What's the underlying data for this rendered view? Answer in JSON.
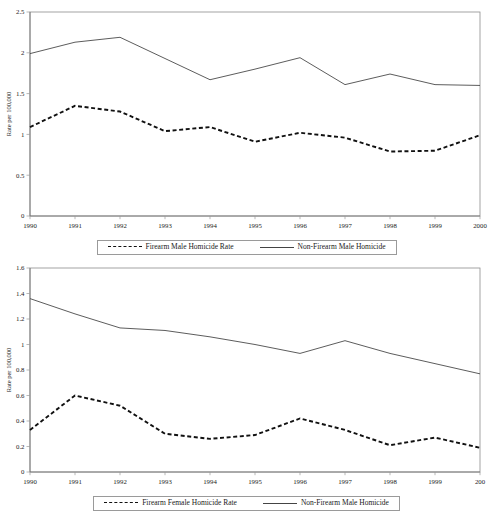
{
  "figure": {
    "ylabel": "Rate per 100,000"
  },
  "chart_data": [
    {
      "type": "line",
      "id": "male-homicide-rates",
      "title": "",
      "xlabel": "",
      "ylabel": "Rate per 100,000",
      "x": [
        1990,
        1991,
        1992,
        1993,
        1994,
        1995,
        1996,
        1997,
        1998,
        1999,
        2000
      ],
      "categories": [
        "1990",
        "1991",
        "1992",
        "1993",
        "1994",
        "1995",
        "1996",
        "1997",
        "1998",
        "1999",
        "2000"
      ],
      "xlim": [
        1990,
        2000
      ],
      "ylim": [
        0,
        2.5
      ],
      "yticks": [
        0,
        0.5,
        1,
        1.5,
        2,
        2.5
      ],
      "ytick_labels": [
        "0",
        "0.5",
        "1",
        "1.5",
        "2",
        "2.5"
      ],
      "grid": false,
      "legend_position": "below",
      "series": [
        {
          "name": "Firearm Male Homicide Rate",
          "style": "dashed",
          "values": [
            1.09,
            1.35,
            1.28,
            1.04,
            1.09,
            0.91,
            1.02,
            0.96,
            0.79,
            0.8,
            0.99
          ]
        },
        {
          "name": "Non-Firearm Male Homicide",
          "style": "solid",
          "values": [
            1.99,
            2.13,
            2.19,
            1.93,
            1.67,
            1.8,
            1.94,
            1.61,
            1.74,
            1.61,
            1.6
          ]
        }
      ]
    },
    {
      "type": "line",
      "id": "female-homicide-rates",
      "title": "",
      "xlabel": "",
      "ylabel": "Rate per 100,000",
      "x": [
        1990,
        1991,
        1992,
        1993,
        1994,
        1995,
        1996,
        1997,
        1998,
        1999,
        2000
      ],
      "categories": [
        "1990",
        "1991",
        "1992",
        "1993",
        "1994",
        "1995",
        "1996",
        "1997",
        "1998",
        "1999",
        "200"
      ],
      "xlim": [
        1990,
        2000
      ],
      "ylim": [
        0,
        1.6
      ],
      "yticks": [
        0,
        0.2,
        0.4,
        0.6,
        0.8,
        1,
        1.2,
        1.4,
        1.6
      ],
      "ytick_labels": [
        "0",
        "0.2",
        "0.4",
        "0.6",
        "0.8",
        "1",
        "1.2",
        "1.4",
        "1.6"
      ],
      "grid": false,
      "legend_position": "below",
      "series": [
        {
          "name": "Firearm Female Homicide Rate",
          "style": "dashed",
          "values": [
            0.33,
            0.6,
            0.52,
            0.3,
            0.26,
            0.29,
            0.42,
            0.33,
            0.21,
            0.27,
            0.19
          ]
        },
        {
          "name": "Non-Firearm Male Homicide",
          "style": "solid",
          "values": [
            1.36,
            1.24,
            1.13,
            1.11,
            1.06,
            1.0,
            0.93,
            1.03,
            0.93,
            0.85,
            0.77
          ]
        }
      ]
    }
  ]
}
